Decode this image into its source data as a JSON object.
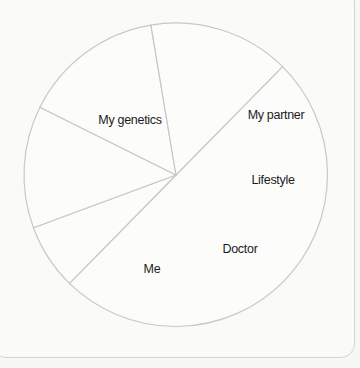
{
  "chart_data": {
    "type": "pie",
    "title": "",
    "categories": [
      "My genetics",
      "My partner",
      "Lifestyle",
      "Doctor",
      "Me"
    ],
    "values": [
      50,
      7,
      13,
      15,
      15
    ],
    "unit": "%",
    "legend": "none (labels inside slices)",
    "start_angle_deg": 45.5,
    "direction": "clockwise",
    "colors": {
      "slice_fill": "#fcfcfb",
      "slice_stroke": "#c8c8c6",
      "label": "#1b1b1b",
      "background": "#f7f7f6"
    }
  },
  "labels": {
    "genetics": "My genetics",
    "partner": "My partner",
    "lifestyle": "Lifestyle",
    "doctor": "Doctor",
    "me": "Me"
  }
}
